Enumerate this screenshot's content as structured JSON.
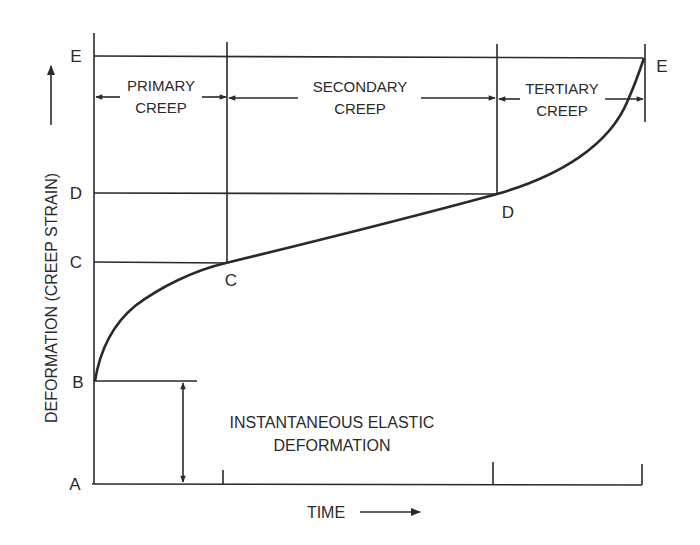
{
  "figure": {
    "axes": {
      "y_label": "DEFORMATION (CREEP STRAIN)",
      "x_label": "TIME"
    },
    "y_levels": {
      "A": "A",
      "B": "B",
      "C": "C",
      "D": "D",
      "E": "E"
    },
    "curve_points": {
      "C": "C",
      "D": "D",
      "E": "E"
    },
    "phases": [
      {
        "line1": "PRIMARY",
        "line2": "CREEP"
      },
      {
        "line1": "SECONDARY",
        "line2": "CREEP"
      },
      {
        "line1": "TERTIARY",
        "line2": "CREEP"
      }
    ],
    "annotation": {
      "line1": "INSTANTANEOUS ELASTIC",
      "line2": "DEFORMATION"
    },
    "colors": {
      "ink": "#2a2a2a",
      "background": "#ffffff"
    }
  }
}
